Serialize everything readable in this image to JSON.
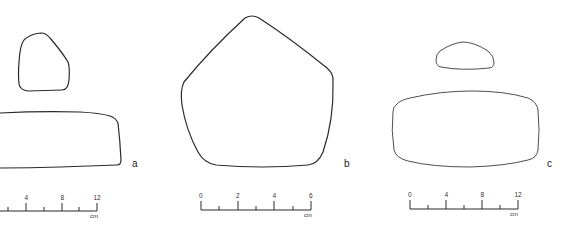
{
  "figures": [
    {
      "id": "a",
      "label": "a",
      "views": [
        "cross-section (top, rounded triangular)",
        "side view (elongated rectangle)"
      ],
      "scale": {
        "ticks": [
          "4",
          "8",
          "12"
        ],
        "unit": "cm",
        "hidden_zero": "0"
      }
    },
    {
      "id": "b",
      "label": "b",
      "views": [
        "plan view (pentagonal)"
      ],
      "scale": {
        "ticks": [
          "0",
          "2",
          "4",
          "6"
        ],
        "unit": "cm"
      }
    },
    {
      "id": "c",
      "label": "c",
      "views": [
        "cross-section (top, flattened trapezoid)",
        "side view (rounded rectangle)"
      ],
      "scale": {
        "ticks": [
          "0",
          "4",
          "8",
          "12"
        ],
        "unit": "cm"
      }
    }
  ],
  "colors": {
    "line": "#2a2a2a",
    "background": "#ffffff"
  }
}
